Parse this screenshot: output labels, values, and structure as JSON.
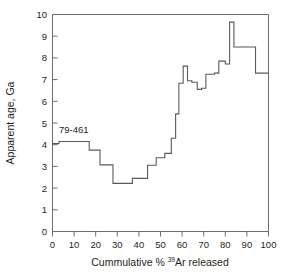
{
  "figure": {
    "background_color": "#ffffff",
    "line_color": "#58595b",
    "axis_color": "#6d6e71",
    "text_color": "#231f20"
  },
  "annotations": {
    "sample_label": "79-461"
  },
  "axis": {
    "x_title_part1": "Cummulative % ",
    "x_title_sup": "39",
    "x_title_part2": "Ar released",
    "y_title": "Apparent age, Ga",
    "x_ticks": [
      "0",
      "10",
      "20",
      "30",
      "40",
      "50",
      "60",
      "70",
      "80",
      "90",
      "100"
    ],
    "y_ticks": [
      "0",
      "1",
      "2",
      "3",
      "4",
      "5",
      "6",
      "7",
      "8",
      "9",
      "10"
    ]
  },
  "chart_data": {
    "type": "line",
    "subtype": "ar-ar-step-heating-age-spectrum",
    "title": "",
    "xlabel": "Cummulative % 39Ar released",
    "ylabel": "Apparent age, Ga",
    "xlim": [
      0,
      100
    ],
    "ylim": [
      0,
      10
    ],
    "xtick_step": 10,
    "ytick_step": 1,
    "grid": false,
    "legend": false,
    "annotation_text": "79-461",
    "annotation_x": 4,
    "annotation_y": 4.75,
    "step_edges": [
      0,
      3,
      17,
      22,
      28,
      37,
      44,
      48,
      52,
      55,
      57,
      58.5,
      60.5,
      62.5,
      64.5,
      67,
      69,
      71,
      75,
      77,
      80,
      82,
      84,
      94,
      100
    ],
    "step_values": [
      4.05,
      4.15,
      3.75,
      3.07,
      2.22,
      2.45,
      3.05,
      3.4,
      3.6,
      4.3,
      5.42,
      6.83,
      7.62,
      6.95,
      6.88,
      6.55,
      6.6,
      7.25,
      7.3,
      7.85,
      7.72,
      9.65,
      8.5,
      7.3
    ],
    "steps": [
      {
        "x_start": 0,
        "x_end": 3,
        "age": 4.05
      },
      {
        "x_start": 3,
        "x_end": 17,
        "age": 4.15
      },
      {
        "x_start": 17,
        "x_end": 22,
        "age": 3.75
      },
      {
        "x_start": 22,
        "x_end": 28,
        "age": 3.07
      },
      {
        "x_start": 28,
        "x_end": 37,
        "age": 2.22
      },
      {
        "x_start": 37,
        "x_end": 44,
        "age": 2.45
      },
      {
        "x_start": 44,
        "x_end": 48,
        "age": 3.05
      },
      {
        "x_start": 48,
        "x_end": 52,
        "age": 3.4
      },
      {
        "x_start": 52,
        "x_end": 55,
        "age": 3.6
      },
      {
        "x_start": 55,
        "x_end": 57,
        "age": 4.3
      },
      {
        "x_start": 57,
        "x_end": 58.5,
        "age": 5.42
      },
      {
        "x_start": 58.5,
        "x_end": 60.5,
        "age": 6.83
      },
      {
        "x_start": 60.5,
        "x_end": 62.5,
        "age": 7.62
      },
      {
        "x_start": 62.5,
        "x_end": 64.5,
        "age": 6.95
      },
      {
        "x_start": 64.5,
        "x_end": 67,
        "age": 6.88
      },
      {
        "x_start": 67,
        "x_end": 69,
        "age": 6.55
      },
      {
        "x_start": 69,
        "x_end": 71,
        "age": 6.6
      },
      {
        "x_start": 71,
        "x_end": 75,
        "age": 7.25
      },
      {
        "x_start": 75,
        "x_end": 77,
        "age": 7.3
      },
      {
        "x_start": 77,
        "x_end": 80,
        "age": 7.85
      },
      {
        "x_start": 80,
        "x_end": 82,
        "age": 7.72
      },
      {
        "x_start": 82,
        "x_end": 84,
        "age": 9.65
      },
      {
        "x_start": 84,
        "x_end": 94,
        "age": 8.5
      },
      {
        "x_start": 94,
        "x_end": 100,
        "age": 7.3
      }
    ]
  }
}
